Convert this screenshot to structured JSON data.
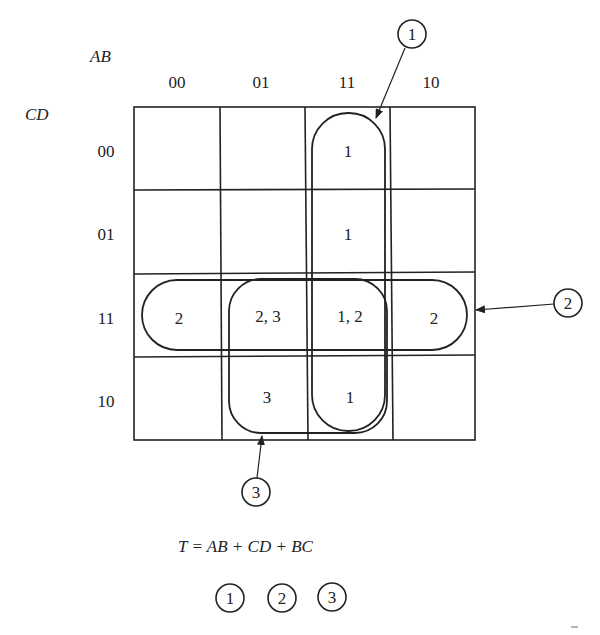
{
  "axis": {
    "row_var": "AB",
    "col_var": "CD",
    "ab_labels": [
      "00",
      "01",
      "11",
      "10"
    ],
    "cd_labels": [
      "00",
      "01",
      "11",
      "10"
    ]
  },
  "cells": {
    "r0": [
      "",
      "",
      "1",
      ""
    ],
    "r1": [
      "",
      "",
      "1",
      ""
    ],
    "r2": [
      "2",
      "2, 3",
      "1, 2",
      "2"
    ],
    "r3": [
      "",
      "3",
      "1",
      ""
    ]
  },
  "groups": {
    "g1": "1",
    "g2": "2",
    "g3": "3"
  },
  "equation": "T = AB + CD + BC",
  "legend": [
    "1",
    "2",
    "3"
  ]
}
